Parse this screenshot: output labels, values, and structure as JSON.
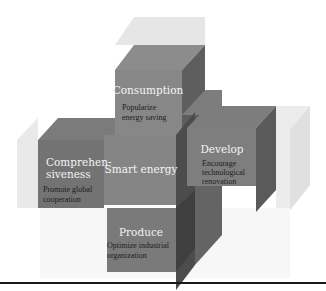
{
  "diagram": {
    "center": {
      "title": "Smart energy"
    },
    "blocks": [
      {
        "id": "consumption",
        "title": "Consumption",
        "desc": [
          "Popularize",
          "energy saving"
        ]
      },
      {
        "id": "comprehensiveness",
        "title": [
          "Comprehen-",
          "siveness"
        ],
        "desc": [
          "Promote global",
          "cooperation"
        ]
      },
      {
        "id": "develop",
        "title": "Develop",
        "desc": [
          "Encourage",
          "technological",
          "renovation"
        ]
      },
      {
        "id": "produce",
        "title": "Produce",
        "desc": [
          "Optimize industrial",
          "organization"
        ]
      }
    ]
  },
  "colors": {
    "front": "#8a8a8a",
    "front_dark": "#7a7a7a",
    "side": "#5f5f5f",
    "side_dark": "#4a4a4a",
    "top": "#9a9a9a",
    "ghost_top": "#e4e4e4",
    "ghost_side": "#ececec",
    "rule": "#1a1a1a"
  }
}
